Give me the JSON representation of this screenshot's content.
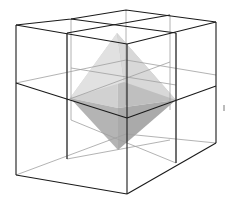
{
  "figure": {
    "title": "Octahedron inscribed in a cube divided into eight sub-cubes",
    "colors": {
      "background": "#ffffff",
      "front_edges": "#1a1a1a",
      "hidden_edges": "#9a9a9a",
      "octa_light": "#d6d6d6",
      "octa_mid": "#bdbdbd",
      "octa_dark": "#9e9e9e"
    }
  }
}
